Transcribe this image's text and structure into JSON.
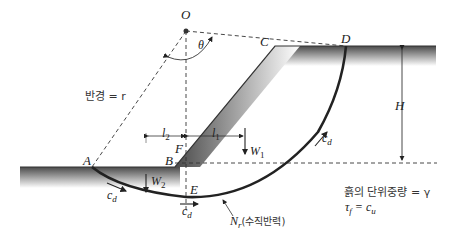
{
  "diagram": {
    "type": "slope-stability-circular-failure",
    "points": {
      "O": "O",
      "A": "A",
      "B": "B",
      "C": "C",
      "D": "D",
      "E": "E",
      "F": "F"
    },
    "labels": {
      "theta": "θ",
      "radius": "반경 = r",
      "height": "H",
      "l1_main": "l",
      "l1_sub": "1",
      "l2_main": "l",
      "l2_sub": "2",
      "w1_main": "W",
      "w1_sub": "1",
      "w2_main": "W",
      "w2_sub": "2",
      "cd_main": "c",
      "cd_sub": "d",
      "nr_main": "N",
      "nr_sub": "r",
      "nr_desc": "(수직반력)",
      "unit_weight": "흙의 단위중량 = γ",
      "shear_strength_lhs": "τ",
      "shear_strength_sub": "f",
      "shear_strength_eq": " = c",
      "shear_strength_rhs_sub": "u"
    },
    "colors": {
      "line": "#222222",
      "soil_dark": "#555555",
      "soil_light": "#ffffff"
    }
  }
}
